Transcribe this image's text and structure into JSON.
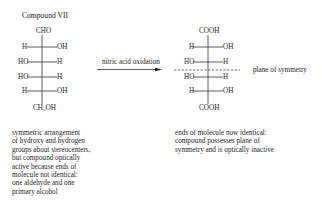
{
  "title": "Compound VII",
  "left_molecule": {
    "top_group": "CHO",
    "rows": [
      {
        "left": "H",
        "right": "OH"
      },
      {
        "left": "HO",
        "right": "H"
      },
      {
        "left": "HO",
        "right": "H"
      },
      {
        "left": "H",
        "right": "OH"
      }
    ],
    "bottom_group": "CH₂OH"
  },
  "reaction": {
    "label": "nitric acid oxidation"
  },
  "right_molecule": {
    "top_group": "COOH",
    "rows": [
      {
        "left": "H",
        "right": "OH"
      },
      {
        "left": "HO",
        "right": "H"
      },
      {
        "left": "HO",
        "right": "H"
      },
      {
        "left": "H",
        "right": "OH"
      }
    ],
    "bottom_group": "COOH"
  },
  "symmetry_label": "plane of symmetry",
  "left_caption": "symmetric arrangement\nof hydroxy and hydrogen\ngroups about stereocenters,\nbut compound optically\nactive because ends of\nmolecule not identical:\none aldehyde and one\nprimary alcohol",
  "right_caption": "ends of molecule now identical:\ncompound possesses plane of\nsymmetry and is optically inactive"
}
